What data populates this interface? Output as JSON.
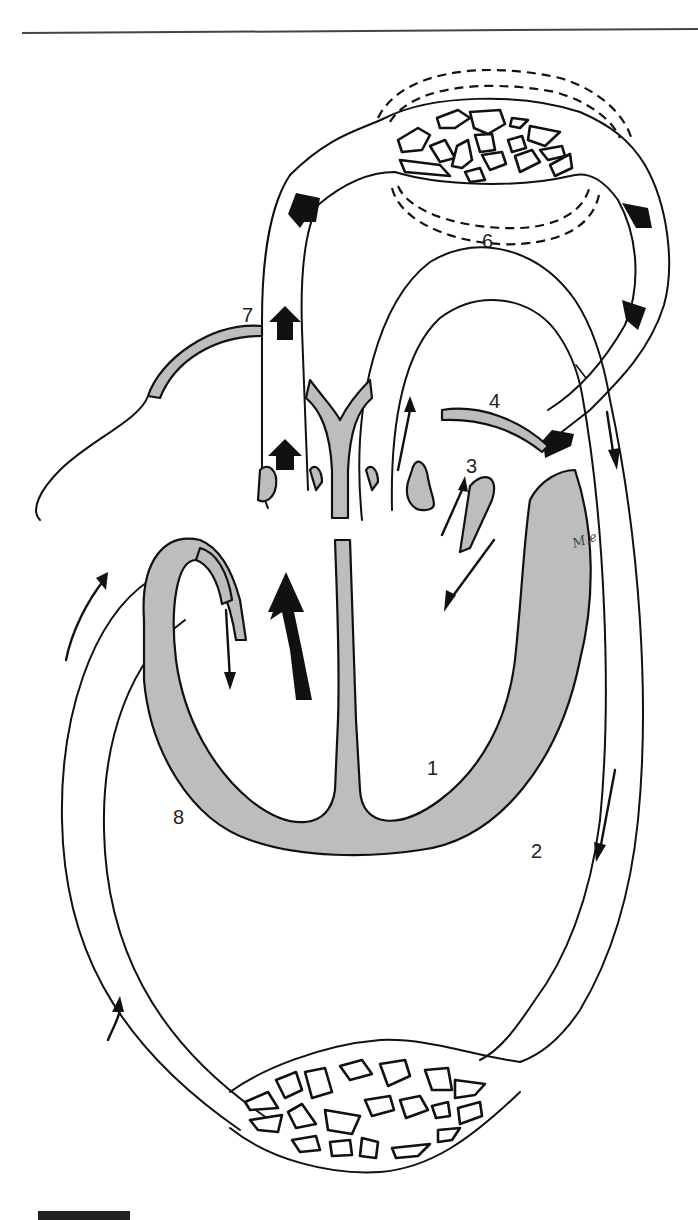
{
  "figure": {
    "type": "schematic of heart and double circulation",
    "labels": [
      {
        "id": "1",
        "text": "1",
        "x": 427,
        "y": 775
      },
      {
        "id": "2",
        "text": "2",
        "x": 531,
        "y": 858
      },
      {
        "id": "3",
        "text": "3",
        "x": 466,
        "y": 473
      },
      {
        "id": "4",
        "text": "4",
        "x": 489,
        "y": 408
      },
      {
        "id": "6",
        "text": "6",
        "x": 482,
        "y": 248
      },
      {
        "id": "7",
        "text": "7",
        "x": 242,
        "y": 322
      },
      {
        "id": "8",
        "text": "8",
        "x": 173,
        "y": 824
      }
    ],
    "signature": "M.e",
    "colors": {
      "line": "#111111",
      "wall_fill": "#bdbdbd",
      "background": "#ffffff",
      "arrow": "#111111"
    },
    "regions": {
      "top_capillary_bed": "pulmonary capillaries (6)",
      "bottom_capillary_bed": "systemic capillaries",
      "heart": "four-chamber heart with muscular walls"
    }
  }
}
